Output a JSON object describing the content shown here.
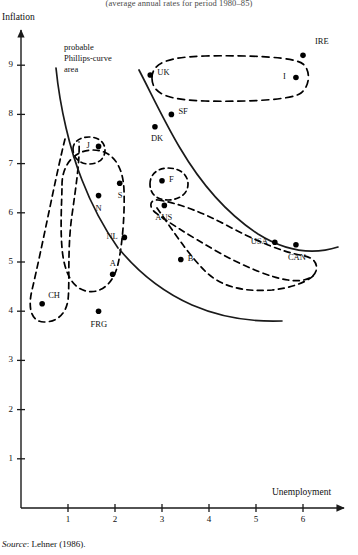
{
  "figure": {
    "caption_top": "(average annual rates for period 1980–85)",
    "source": "Source: Lehner (1986).",
    "source_prefix": "Source",
    "source_rest": ": Lehner (1986)."
  },
  "annotations": {
    "phillips_area": "probable\nPhillips-curve\narea",
    "phillips_area_line1": "probable",
    "phillips_area_line2": "Phillips-curve",
    "phillips_area_line3": "area"
  },
  "colors": {
    "ink": "#111111",
    "point": "#000000",
    "axis": "#222222",
    "dashed": "#000000"
  },
  "chart_data": {
    "type": "scatter",
    "title": "(average annual rates for period 1980–85)",
    "xlabel": "Unemployment",
    "ylabel": "Inflation",
    "xlim": [
      0,
      6.8
    ],
    "ylim": [
      0,
      9.8
    ],
    "xticks": [
      1,
      2,
      3,
      4,
      5,
      6
    ],
    "yticks": [
      1,
      2,
      3,
      4,
      5,
      6,
      7,
      8,
      9
    ],
    "xtick_labels": [
      "1",
      "2",
      "3",
      "4",
      "5",
      "6"
    ],
    "ytick_labels": [
      "1",
      "2",
      "3",
      "4",
      "5",
      "6",
      "7",
      "8",
      "9"
    ],
    "grid": false,
    "legend": "none",
    "points": [
      {
        "label": "IRE",
        "x": 6.0,
        "y": 9.2,
        "lx": 12,
        "ly": -14
      },
      {
        "label": "UK",
        "x": 2.75,
        "y": 8.8,
        "lx": 7,
        "ly": -3
      },
      {
        "label": "I",
        "x": 5.85,
        "y": 8.75,
        "lx": -13,
        "ly": -2
      },
      {
        "label": "SF",
        "x": 3.2,
        "y": 8.0,
        "lx": 7,
        "ly": -3
      },
      {
        "label": "DK",
        "x": 2.85,
        "y": 7.75,
        "lx": -4,
        "ly": 11
      },
      {
        "label": "J",
        "x": 1.65,
        "y": 7.35,
        "lx": -12,
        "ly": -1
      },
      {
        "label": "F",
        "x": 3.0,
        "y": 6.65,
        "lx": 7,
        "ly": -2
      },
      {
        "label": "S",
        "x": 2.1,
        "y": 6.6,
        "lx": -2,
        "ly": 12
      },
      {
        "label": "N",
        "x": 1.65,
        "y": 6.35,
        "lx": -3,
        "ly": 12
      },
      {
        "label": "AUS",
        "x": 3.05,
        "y": 6.15,
        "lx": -9,
        "ly": 12
      },
      {
        "label": "NL",
        "x": 2.2,
        "y": 5.5,
        "lx": -18,
        "ly": -1
      },
      {
        "label": "USA",
        "x": 5.4,
        "y": 5.4,
        "lx": -24,
        "ly": -1
      },
      {
        "label": "CAN",
        "x": 5.85,
        "y": 5.35,
        "lx": -8,
        "ly": 12
      },
      {
        "label": "B",
        "x": 3.4,
        "y": 5.05,
        "lx": 7,
        "ly": -2
      },
      {
        "label": "A",
        "x": 1.95,
        "y": 4.75,
        "lx": -3,
        "ly": -11
      },
      {
        "label": "CH",
        "x": 0.45,
        "y": 4.15,
        "lx": 6,
        "ly": -9
      },
      {
        "label": "FRG",
        "x": 1.65,
        "y": 4.0,
        "lx": -8,
        "ly": 13
      }
    ],
    "curves": [
      {
        "name": "phillips-curve-upper",
        "style": "solid"
      },
      {
        "name": "phillips-curve-lower",
        "style": "solid"
      }
    ],
    "clusters": [
      {
        "name": "uk-ireland-italy-cluster",
        "members": [
          "UK",
          "I",
          "IRE"
        ],
        "style": "dashed"
      },
      {
        "name": "switzerland-cluster",
        "members": [
          "CH"
        ],
        "style": "dashed"
      },
      {
        "name": "japan-cluster",
        "members": [
          "J"
        ],
        "style": "dashed"
      },
      {
        "name": "nordic-austria-cluster",
        "members": [
          "N",
          "S",
          "NL",
          "A"
        ],
        "style": "dashed"
      },
      {
        "name": "france-cluster",
        "members": [
          "F"
        ],
        "style": "dashed"
      },
      {
        "name": "north-america-cluster",
        "members": [
          "USA",
          "CAN"
        ],
        "style": "dashed"
      }
    ]
  }
}
